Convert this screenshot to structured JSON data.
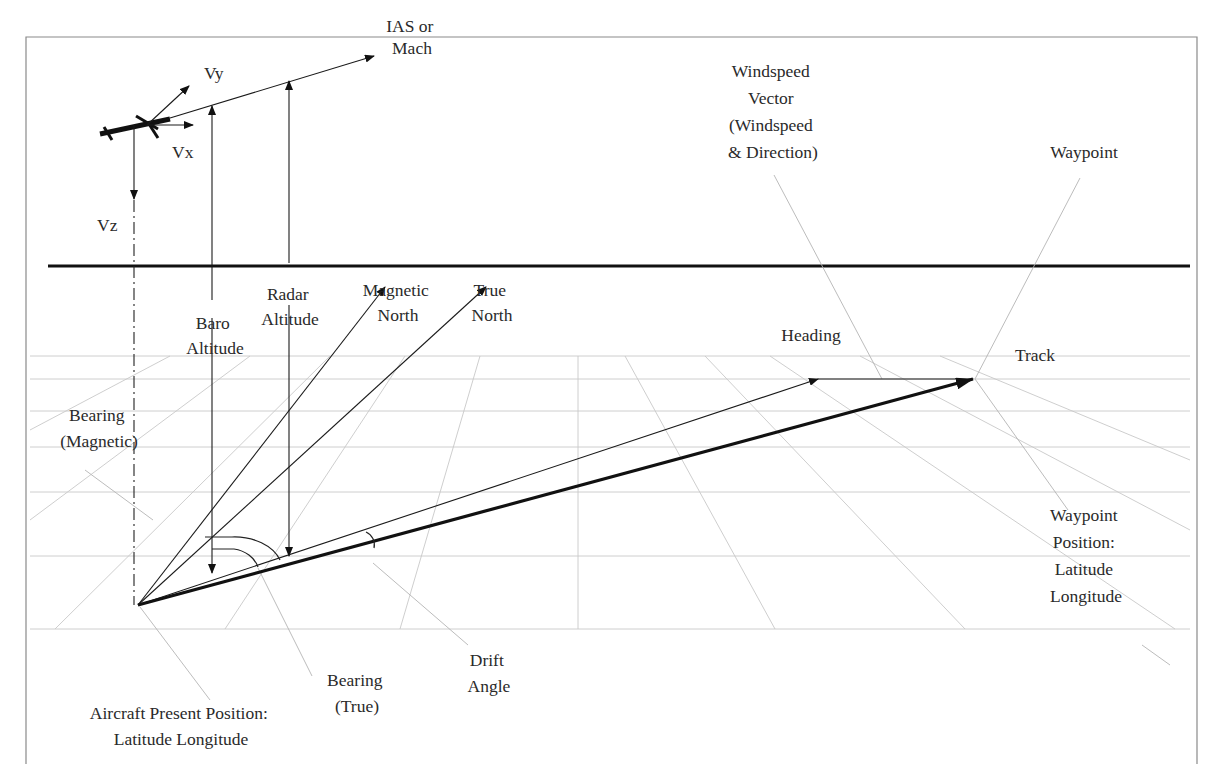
{
  "figure": {
    "colors": {
      "line": "#111111",
      "grid": "#c8c8c8",
      "leader": "#b4b4b4",
      "text": "#2a2a2a",
      "background": "#ffffff"
    }
  },
  "labels": {
    "ias": [
      "IAS or",
      "Mach"
    ],
    "vy": "Vy",
    "vx": "Vx",
    "vz": "Vz",
    "windspeed": [
      "Windspeed",
      "Vector",
      "(Windspeed",
      "& Direction)"
    ],
    "waypoint": "Waypoint",
    "baro_altitude": [
      "Baro",
      "Altitude"
    ],
    "radar_altitude": [
      "Radar",
      "Altitude"
    ],
    "magnetic_north": [
      "Magnetic",
      "North"
    ],
    "true_north": [
      "True",
      "North"
    ],
    "heading": "Heading",
    "track": "Track",
    "bearing_magnetic": [
      "Bearing",
      "(Magnetic)"
    ],
    "waypoint_position": [
      "Waypoint",
      "Position:",
      "Latitude",
      "Longitude"
    ],
    "bearing_true": [
      "Bearing",
      "(True)"
    ],
    "drift_angle": [
      "Drift",
      "Angle"
    ],
    "aircraft_position": [
      "Aircraft Present Position:",
      "Latitude Longitude"
    ]
  }
}
